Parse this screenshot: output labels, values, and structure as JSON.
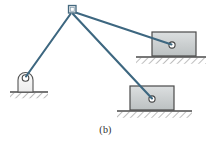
{
  "figure": {
    "caption": "(b)",
    "label": "(b)",
    "type": "statics-free-body-diagram",
    "background_color": "#ffffff"
  },
  "colors": {
    "cable": "#3d6780",
    "cable_outline": "#2f5467",
    "block_fill": "#c9cdce",
    "block_fill_light": "#d9dcdd",
    "block_stroke": "#4a4a4a",
    "ground_line": "#4a4a4a",
    "hatch": "#6e6e6e",
    "support_fill": "#f2f2f2",
    "support_stroke": "#555555",
    "pin_fill": "#ffffff",
    "pin_stroke": "#444444",
    "caption_text": "#2b2b2b"
  },
  "nodes": {
    "apex_pulley": {
      "name": "apex-pulley-bracket",
      "x": 69,
      "y": 9,
      "width": 7,
      "height": 7
    },
    "left_support_pin": {
      "name": "left-support-pin",
      "x": 25,
      "y": 78,
      "radius": 3.2
    },
    "upper_block_pin": {
      "name": "upper-block-pin",
      "x": 172,
      "y": 45,
      "radius": 3.0
    },
    "lower_block_pin": {
      "name": "lower-block-pin",
      "x": 152,
      "y": 99,
      "radius": 3.0
    }
  },
  "cables": [
    {
      "name": "cable-apex-to-left-support",
      "from": "apex_pulley",
      "to": "left_support_pin",
      "x1": 70,
      "y1": 14,
      "x2": 26,
      "y2": 77
    },
    {
      "name": "cable-apex-to-upper-block",
      "from": "apex_pulley",
      "to": "upper_block_pin",
      "x1": 74,
      "y1": 12,
      "x2": 171,
      "y2": 45
    },
    {
      "name": "cable-apex-to-lower-block",
      "from": "apex_pulley",
      "to": "lower_block_pin",
      "x1": 73,
      "y1": 14,
      "x2": 152,
      "y2": 99
    }
  ],
  "blocks": [
    {
      "name": "upper-right-block",
      "x": 152,
      "y": 32,
      "width": 44,
      "height": 24,
      "ground_y": 57,
      "ground_x1": 136,
      "ground_x2": 206
    },
    {
      "name": "lower-right-block",
      "x": 130,
      "y": 86,
      "width": 44,
      "height": 24,
      "ground_y": 111,
      "ground_x1": 117,
      "ground_x2": 192
    }
  ],
  "supports": [
    {
      "name": "left-pedestal-support",
      "x": 16,
      "y": 72,
      "width": 20,
      "height": 20,
      "ground_y": 92,
      "ground_x1": 10,
      "ground_x2": 48
    }
  ]
}
